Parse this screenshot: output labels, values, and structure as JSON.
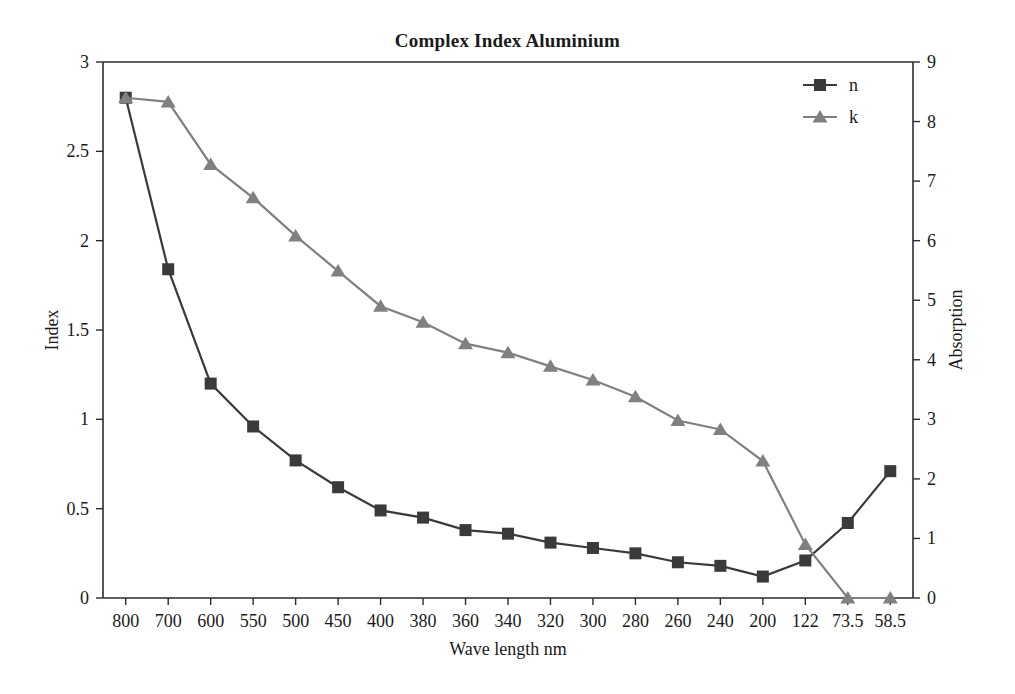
{
  "chart_data": {
    "type": "line",
    "title": "Complex Index Aluminium",
    "xlabel": "Wave length nm",
    "ylabel": "Index",
    "y2label": "Absorption",
    "categories": [
      "800",
      "700",
      "600",
      "550",
      "500",
      "450",
      "400",
      "380",
      "360",
      "340",
      "320",
      "300",
      "280",
      "260",
      "240",
      "200",
      "122",
      "73.5",
      "58.5"
    ],
    "ylim": [
      0,
      3
    ],
    "yticks": [
      "0",
      "0.5",
      "1",
      "1.5",
      "2",
      "2.5",
      "3"
    ],
    "y2lim": [
      0,
      9
    ],
    "y2ticks": [
      "0",
      "1",
      "2",
      "3",
      "4",
      "5",
      "6",
      "7",
      "8",
      "9"
    ],
    "grid": false,
    "legend_position": "top-right",
    "series": [
      {
        "name": "n",
        "axis": "left",
        "marker": "square",
        "color": "#3a3a3a",
        "values": [
          2.8,
          1.84,
          1.2,
          0.96,
          0.77,
          0.62,
          0.49,
          0.45,
          0.38,
          0.36,
          0.31,
          0.28,
          0.25,
          0.2,
          0.18,
          0.12,
          0.21,
          0.42,
          0.71
        ]
      },
      {
        "name": "k",
        "axis": "right",
        "marker": "triangle",
        "color": "#808080",
        "values": [
          8.4,
          8.33,
          7.28,
          6.72,
          6.08,
          5.49,
          4.9,
          4.63,
          4.27,
          4.12,
          3.89,
          3.66,
          3.38,
          2.98,
          2.83,
          2.3,
          0.9,
          0.0,
          0.0
        ]
      }
    ]
  },
  "legend": {
    "entries": [
      {
        "label": "n"
      },
      {
        "label": "k"
      }
    ]
  },
  "colors": {
    "series_n": "#3a3a3a",
    "series_k": "#808080",
    "axis": "#2b2b2b",
    "text": "#1a1a1a",
    "background": "#ffffff"
  }
}
